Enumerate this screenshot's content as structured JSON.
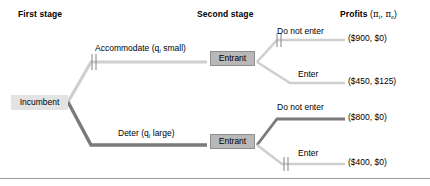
{
  "headers": {
    "first_stage": "First stage",
    "second_stage": "Second stage",
    "profits": "Profits",
    "profits_symbols": "(πi, πe)",
    "profit_pi": "π",
    "profit_sub_incumbent": "i",
    "profit_sub_entrant": "e"
  },
  "nodes": {
    "incumbent": "Incumbent",
    "entrant_top": "Entrant",
    "entrant_bottom": "Entrant"
  },
  "edges": {
    "accommodate": "Accommodate (q",
    "accommodate_sub": "i",
    "accommodate_tail": " small)",
    "accommodate_full": "Accommodate (qi small)",
    "deter": "Deter (q",
    "deter_sub": "i",
    "deter_tail": " large)",
    "deter_full": "Deter (qi large)",
    "do_not_enter_top": "Do not enter",
    "enter_top": "Enter",
    "do_not_enter_bottom": "Do not enter",
    "enter_bottom": "Enter"
  },
  "payoffs": {
    "accommodate_do_not_enter": "($900, $0)",
    "accommodate_enter": "($450, $125)",
    "deter_do_not_enter": "($800, $0)",
    "deter_enter": "($400, $0)"
  },
  "colors": {
    "equilibrium_path": "#7a7a7a",
    "pruned_path": "#cfcfcf",
    "incumbent_node_fill": "#e3e3e3",
    "entrant_node_fill": "#b8b8b8",
    "entrant_node_border": "#8e8e8e",
    "text": "#000000",
    "rule": "#9a9a9a"
  },
  "annotations": {
    "pruned_marks": [
      "accommodate-branch",
      "do-not-enter-top-branch",
      "enter-bottom-branch"
    ],
    "equilibrium_branches": [
      "deter-branch",
      "do-not-enter-bottom-branch"
    ]
  }
}
